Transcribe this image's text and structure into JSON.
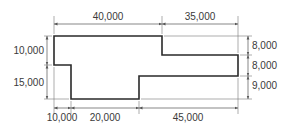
{
  "diagram": {
    "type": "dimensioned floor plan outline",
    "colors": {
      "outline": "#2a2a2a",
      "dimension_line": "#555555",
      "text": "#3a3a3a"
    },
    "top_dimensions": [
      {
        "label": "40,000"
      },
      {
        "label": "35,000"
      }
    ],
    "left_dimensions": [
      {
        "label": "10,000"
      },
      {
        "label": "15,000"
      }
    ],
    "right_dimensions": [
      {
        "label": "8,000"
      },
      {
        "label": "8,000"
      },
      {
        "label": "9,000"
      }
    ],
    "bottom_dimensions": [
      {
        "label": "10,000"
      },
      {
        "label": "20,000"
      },
      {
        "label": "45,000"
      }
    ]
  }
}
